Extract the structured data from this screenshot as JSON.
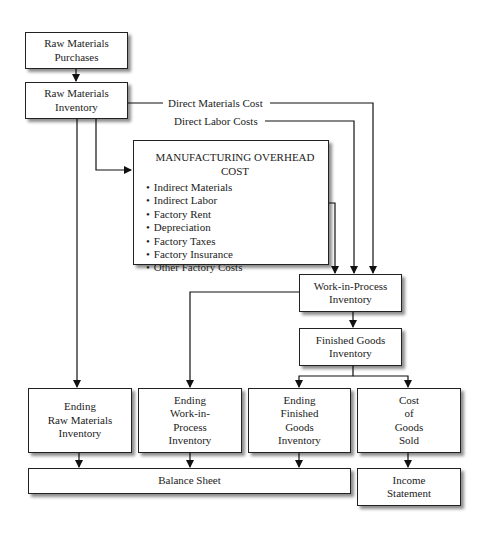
{
  "diagram": {
    "nodes": {
      "raw_materials_purchases": {
        "line1": "Raw Materials",
        "line2": "Purchases"
      },
      "raw_materials_inventory": {
        "line1": "Raw Materials",
        "line2": "Inventory"
      },
      "manufacturing_overhead": {
        "title": "MANUFACTURING OVERHEAD COST",
        "items": [
          "Indirect Materials",
          "Indirect Labor",
          "Factory Rent",
          "Depreciation",
          "Factory Taxes",
          "Factory Insurance",
          "Other Factory Costs"
        ]
      },
      "work_in_process_inventory": {
        "line1": "Work-in-Process",
        "line2": "Inventory"
      },
      "finished_goods_inventory": {
        "line1": "Finished Goods",
        "line2": "Inventory"
      },
      "ending_raw_materials_inventory": {
        "line1": "Ending",
        "line2": "Raw Materials",
        "line3": "Inventory"
      },
      "ending_wip_inventory": {
        "line1": "Ending",
        "line2": "Work-in-",
        "line3": "Process",
        "line4": "Inventory"
      },
      "ending_finished_goods_inventory": {
        "line1": "Ending",
        "line2": "Finished",
        "line3": "Goods",
        "line4": "Inventory"
      },
      "cost_of_goods_sold": {
        "line1": "Cost",
        "line2": "of",
        "line3": "Goods",
        "line4": "Sold"
      },
      "balance_sheet": {
        "label": "Balance Sheet"
      },
      "income_statement": {
        "line1": "Income",
        "line2": "Statement"
      }
    },
    "edge_labels": {
      "direct_materials": "Direct Materials Cost",
      "direct_labor": "Direct Labor Costs"
    },
    "edges": [
      [
        "Raw Materials Purchases",
        "Raw Materials Inventory"
      ],
      [
        "Raw Materials Inventory",
        "Work-in-Process Inventory",
        "Direct Materials Cost"
      ],
      [
        "Direct Labor Costs",
        "Work-in-Process Inventory"
      ],
      [
        "Raw Materials Inventory",
        "Manufacturing Overhead Cost"
      ],
      [
        "Manufacturing Overhead Cost",
        "Work-in-Process Inventory"
      ],
      [
        "Raw Materials Inventory",
        "Ending Raw Materials Inventory"
      ],
      [
        "Work-in-Process Inventory",
        "Ending Work-in-Process Inventory"
      ],
      [
        "Work-in-Process Inventory",
        "Finished Goods Inventory"
      ],
      [
        "Finished Goods Inventory",
        "Ending Finished Goods Inventory"
      ],
      [
        "Finished Goods Inventory",
        "Cost of Goods Sold"
      ],
      [
        "Ending Raw Materials Inventory",
        "Balance Sheet"
      ],
      [
        "Ending Work-in-Process Inventory",
        "Balance Sheet"
      ],
      [
        "Ending Finished Goods Inventory",
        "Balance Sheet"
      ],
      [
        "Cost of Goods Sold",
        "Income Statement"
      ]
    ]
  }
}
